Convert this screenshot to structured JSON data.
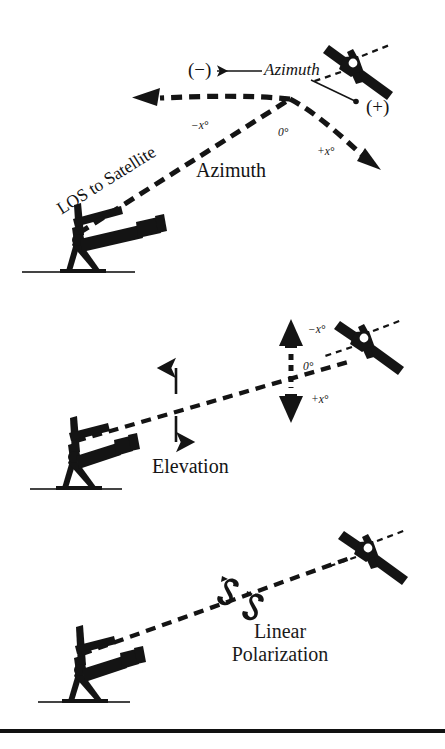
{
  "figure": {
    "ink_color": "#141414",
    "background_color": "#ffffff"
  },
  "panels": [
    {
      "id": "azimuth",
      "name": "Azimuth panel",
      "caption": "Azimuth",
      "los_label": "LOS to Satellite",
      "callout_label": "Azimuth",
      "negative_sign": "(−)",
      "positive_sign": "(+)",
      "angle_negative": "−x°",
      "angle_zero": "0°",
      "angle_positive": "+x°",
      "icons": {
        "satellite": "satellite-icon",
        "antenna": "tracking-antenna-icon",
        "ground": "ground-line-icon"
      }
    },
    {
      "id": "elevation",
      "name": "Elevation panel",
      "caption": "Elevation",
      "angle_negative": "−x°",
      "angle_zero": "0°",
      "angle_positive": "+x°",
      "icons": {
        "satellite": "satellite-icon",
        "antenna": "tracking-antenna-icon",
        "ground": "ground-line-icon",
        "updown": "up-down-arrow-icon"
      }
    },
    {
      "id": "polarization",
      "name": "Linear polarization panel",
      "caption_line1": "Linear",
      "caption_line2": "Polarization",
      "icons": {
        "satellite": "satellite-icon",
        "antenna": "tracking-antenna-icon",
        "ground": "ground-line-icon",
        "rotation": "polarization-rotation-icon"
      }
    }
  ],
  "footer": {
    "rule": "horizontal-rule"
  }
}
